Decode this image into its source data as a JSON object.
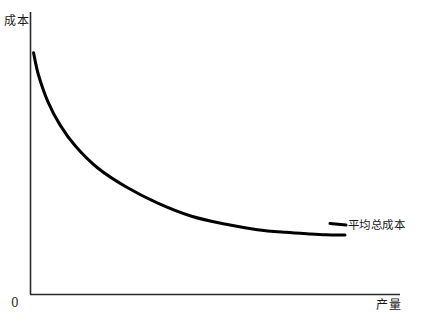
{
  "chart_data": {
    "type": "line",
    "title": "",
    "subtitle": "",
    "xlabel": "产量",
    "ylabel": "成本",
    "origin_label": "0",
    "grid": false,
    "legend_position": "inline-right-end",
    "axes": {
      "x_axis_visible": true,
      "y_axis_visible": true,
      "x_ticks": [],
      "y_ticks": [],
      "xlim": [
        0,
        100
      ],
      "ylim": [
        0,
        100
      ]
    },
    "series": [
      {
        "name": "平均总成本",
        "color": "#000000",
        "label_text": "平均总成本",
        "x": [
          0.5,
          2,
          5,
          9,
          14,
          21,
          30,
          40,
          51,
          62,
          72,
          81,
          89,
          94,
          98,
          100
        ],
        "y": [
          90,
          82,
          72,
          63,
          55,
          47,
          40,
          34,
          29,
          26,
          24,
          23,
          22.4,
          22.1,
          22,
          22
        ]
      }
    ]
  },
  "labels": {
    "y_axis": "成本",
    "x_axis": "产量",
    "origin": "0",
    "curve": "平均总成本"
  },
  "colors": {
    "curve": "#000000",
    "axis": "#2b2b2b",
    "background": "#ffffff",
    "text": "#1a1a1a"
  }
}
